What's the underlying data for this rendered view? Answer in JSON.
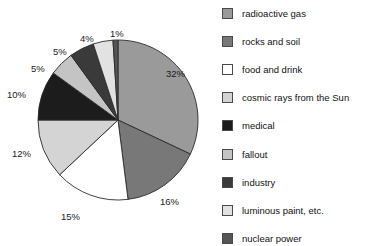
{
  "chart_data": {
    "type": "pie",
    "title": "",
    "subtitle": "",
    "xlabel": "",
    "ylabel": "",
    "legend_position": "right",
    "grid": false,
    "units": "percent",
    "total": 100,
    "start_angle_deg": 0,
    "direction": "clockwise",
    "categories": [
      "radioactive gas",
      "rocks and soil",
      "food and drink",
      "cosmic rays from the Sun",
      "medical",
      "fallout",
      "industry",
      "luminous paint, etc.",
      "nuclear power"
    ],
    "values": [
      32,
      16,
      15,
      12,
      10,
      5,
      5,
      4,
      1
    ],
    "data_labels": [
      "32%",
      "16%",
      "15%",
      "12%",
      "10%",
      "5%",
      "5%",
      "4%",
      "1%"
    ],
    "colors": [
      "#9a9a9a",
      "#787878",
      "#ffffff",
      "#d4d4d4",
      "#1c1c1c",
      "#c4c4c4",
      "#3a3a3a",
      "#e2e2e2",
      "#555555"
    ],
    "slices": [
      {
        "label": "radioactive gas",
        "value": 32,
        "data_label": "32%",
        "color": "#9a9a9a"
      },
      {
        "label": "rocks and soil",
        "value": 16,
        "data_label": "16%",
        "color": "#787878"
      },
      {
        "label": "food and drink",
        "value": 15,
        "data_label": "15%",
        "color": "#ffffff"
      },
      {
        "label": "cosmic rays from the Sun",
        "value": 12,
        "data_label": "12%",
        "color": "#d4d4d4"
      },
      {
        "label": "medical",
        "value": 10,
        "data_label": "10%",
        "color": "#1c1c1c"
      },
      {
        "label": "fallout",
        "value": 5,
        "data_label": "5%",
        "color": "#c4c4c4"
      },
      {
        "label": "industry",
        "value": 5,
        "data_label": "5%",
        "color": "#3a3a3a"
      },
      {
        "label": "luminous paint, etc.",
        "value": 4,
        "data_label": "4%",
        "color": "#e2e2e2"
      },
      {
        "label": "nuclear power",
        "value": 1,
        "data_label": "1%",
        "color": "#555555"
      }
    ]
  },
  "pie": {
    "labels": {
      "l32": "32%",
      "l16": "16%",
      "l15": "15%",
      "l12": "12%",
      "l10": "10%",
      "l5a": "5%",
      "l5b": "5%",
      "l4": "4%",
      "l1": "1%"
    }
  },
  "legend": {
    "items": [
      {
        "label": "radioactive gas",
        "color": "#9a9a9a"
      },
      {
        "label": "rocks and soil",
        "color": "#787878"
      },
      {
        "label": "food and drink",
        "color": "#ffffff"
      },
      {
        "label": "cosmic rays from the Sun",
        "color": "#d4d4d4"
      },
      {
        "label": "medical",
        "color": "#1c1c1c"
      },
      {
        "label": "fallout",
        "color": "#c4c4c4"
      },
      {
        "label": "industry",
        "color": "#3a3a3a"
      },
      {
        "label": "luminous paint, etc.",
        "color": "#e2e2e2"
      },
      {
        "label": "nuclear power",
        "color": "#555555"
      }
    ]
  }
}
